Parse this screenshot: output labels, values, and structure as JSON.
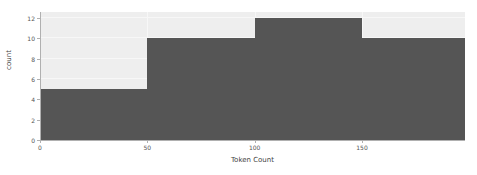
{
  "chart_data": {
    "type": "bar",
    "title": "",
    "subtitle": "",
    "xlabel": "Token Count",
    "ylabel": "count",
    "grid": true,
    "legend": null,
    "orientation": "vertical",
    "style": "histogram",
    "bin_width": 50,
    "bin_edges": [
      0,
      50,
      100,
      150,
      198
    ],
    "categories": [
      "0-50",
      "50-100",
      "100-150",
      "150-198"
    ],
    "values": [
      5,
      10,
      12,
      10
    ],
    "bars": [
      {
        "label": "0-50",
        "x_start": 0,
        "x_end": 50,
        "value": 5
      },
      {
        "label": "50-100",
        "x_start": 50,
        "x_end": 100,
        "value": 10
      },
      {
        "label": "100-150",
        "x_start": 100,
        "x_end": 150,
        "value": 12
      },
      {
        "label": "150-198",
        "x_start": 150,
        "x_end": 198,
        "value": 10
      }
    ],
    "xlim": [
      0,
      198
    ],
    "ylim": [
      0,
      12.6
    ],
    "x_ticks": [
      {
        "value": 0,
        "label": "0"
      },
      {
        "value": 50,
        "label": "50"
      },
      {
        "value": 100,
        "label": "100"
      },
      {
        "value": 150,
        "label": "150"
      }
    ],
    "y_ticks": [
      {
        "value": 0,
        "label": "0"
      },
      {
        "value": 2,
        "label": "2"
      },
      {
        "value": 4,
        "label": "4"
      },
      {
        "value": 6,
        "label": "6"
      },
      {
        "value": 8,
        "label": "8"
      },
      {
        "value": 10,
        "label": "10"
      },
      {
        "value": 12,
        "label": "12"
      }
    ],
    "colors": {
      "bar": "#555555",
      "plot_background": "#eeeeee",
      "figure_background": "#ffffff",
      "gridline": "#f7f7f7",
      "axis": "#b0b0b0",
      "tick_text": "#555555",
      "axis_title_text": "#444444"
    }
  }
}
